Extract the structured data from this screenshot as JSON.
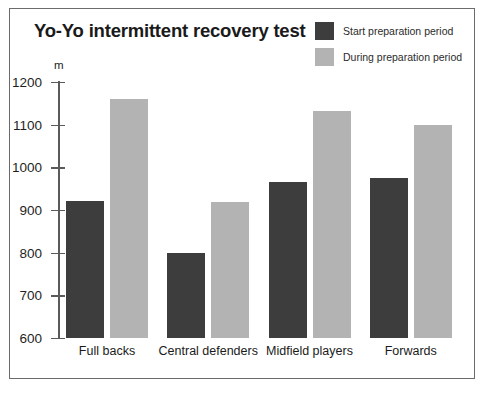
{
  "chart_data": {
    "type": "bar",
    "title": "Yo-Yo intermittent recovery test",
    "xlabel": "",
    "ylabel": "m",
    "ylim": [
      600,
      1200
    ],
    "ytick_step": 100,
    "yticks": [
      1200,
      1100,
      1000,
      900,
      800,
      700,
      600
    ],
    "grid": false,
    "legend_position": "top-right",
    "categories": [
      "Full backs",
      "Central defenders",
      "Midfield players",
      "Forwards"
    ],
    "series": [
      {
        "name": "Start preparation period",
        "color": "#3d3d3d",
        "values": [
          920,
          800,
          965,
          975
        ]
      },
      {
        "name": "During preparation period",
        "color": "#b3b3b3",
        "values": [
          1160,
          918,
          1132,
          1100
        ]
      }
    ]
  },
  "colors": {
    "series_dark": "#3d3d3d",
    "series_light": "#b3b3b3",
    "axis": "#5a5a5a",
    "frame": "#6b6b6b",
    "text": "#1a1a1a",
    "background": "#ffffff"
  }
}
